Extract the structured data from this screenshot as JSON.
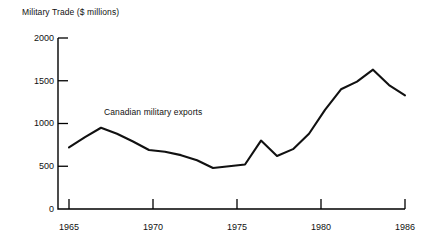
{
  "chart_data": {
    "type": "line",
    "title": "Military Trade ($ millions)",
    "xlabel": "",
    "ylabel": "Military Trade ($ millions)",
    "xlim": [
      1965,
      1986
    ],
    "ylim": [
      0,
      2000
    ],
    "grid": false,
    "legend_position": "inline-annotation",
    "annotations": [
      {
        "text": "Canadian military exports",
        "x": 1967.2,
        "y": 1100
      }
    ],
    "yticks": [
      0,
      500,
      1000,
      1500,
      2000
    ],
    "ytick_labels": [
      "0",
      "500",
      "1000",
      "1500",
      "2000"
    ],
    "xticks": [
      1965,
      1970,
      1975,
      1980,
      1986
    ],
    "xtick_labels": [
      "1965",
      "1970",
      "1975",
      "1980",
      "1986"
    ],
    "series": [
      {
        "name": "Canadian military exports",
        "color": "#111111",
        "x": [
          1965,
          1966,
          1967,
          1968,
          1969,
          1970,
          1971,
          1972,
          1973,
          1974,
          1975,
          1976,
          1977,
          1978,
          1979,
          1980,
          1981,
          1982,
          1983,
          1984,
          1985,
          1986
        ],
        "values": [
          720,
          840,
          950,
          880,
          790,
          690,
          670,
          630,
          570,
          480,
          500,
          520,
          800,
          620,
          700,
          880,
          1160,
          1400,
          1490,
          1630,
          1450,
          1330
        ]
      }
    ]
  },
  "colors": {
    "line": "#111111",
    "axis": "#000000",
    "background": "#ffffff",
    "text": "#111111"
  }
}
